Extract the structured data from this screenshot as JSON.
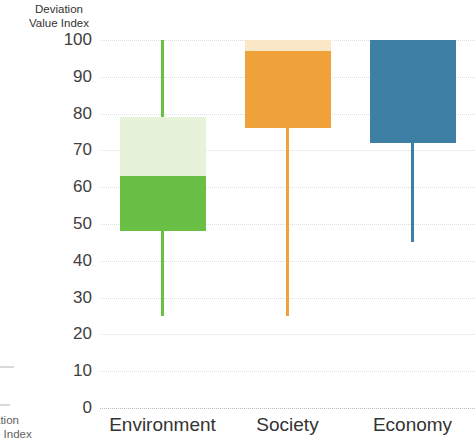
{
  "chart_data": {
    "type": "bar",
    "title": "",
    "subtitle": "",
    "xlabel": "",
    "ylabel": "Deviation\nValue Index",
    "ylim": [
      0,
      100
    ],
    "yticks": [
      100,
      90,
      80,
      70,
      60,
      50,
      40,
      30,
      20,
      10,
      0
    ],
    "ytick_labels": [
      "100",
      "90",
      "80",
      "70",
      "60",
      "50",
      "40",
      "30",
      "20",
      "10",
      "0"
    ],
    "grid": true,
    "grid_style": "dotted",
    "legend": "none",
    "categories": [
      "Environment",
      "Society",
      "Economy"
    ],
    "series": [
      {
        "name": "Environment",
        "color": "#6ABF45",
        "accent_color": "#E6F3D9",
        "whisker_low": 25,
        "whisker_high": 100,
        "box_low": 48,
        "box_high": 79,
        "box_split": 63,
        "segment_upper": [
          63,
          79
        ],
        "segment_lower": [
          48,
          63
        ]
      },
      {
        "name": "Society",
        "color": "#EFA13A",
        "accent_color": "#FAE7C6",
        "whisker_low": 25,
        "whisker_high": 100,
        "box_low": 76,
        "box_high": 100,
        "box_split": 97,
        "segment_upper": [
          97,
          100
        ],
        "segment_lower": [
          76,
          97
        ]
      },
      {
        "name": "Economy",
        "color": "#3E7FA6",
        "accent_color": "#3E7FA6",
        "whisker_low": 45,
        "whisker_high": 100,
        "box_low": 72,
        "box_high": 100,
        "box_split": 100,
        "segment_upper": [
          100,
          100
        ],
        "segment_lower": [
          72,
          100
        ]
      }
    ]
  },
  "axis": {
    "y_title_line1": "Deviation",
    "y_title_line2": "Value Index",
    "y_title": "Deviation\nValue Index"
  },
  "edge_fragment": {
    "line1": "ation",
    "line2": "e Index",
    "text": "ation\ne Index"
  }
}
